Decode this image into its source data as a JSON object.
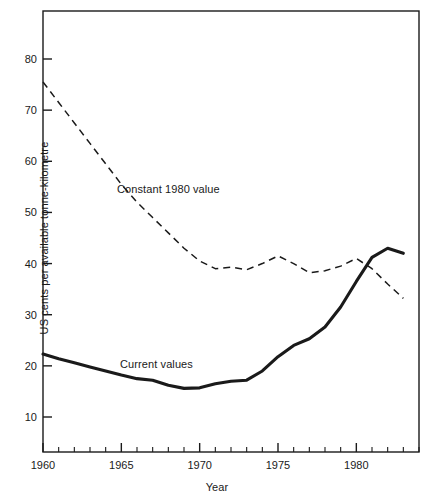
{
  "chart_data": {
    "type": "line",
    "title": "",
    "xlabel": "Year",
    "ylabel": "US cents per available tonne-kilometre",
    "xlim": [
      1960,
      1984
    ],
    "ylim": [
      0,
      88
    ],
    "xticks": [
      1960,
      1965,
      1970,
      1975,
      1980
    ],
    "xtick_labels": [
      "1960",
      "1965",
      "1970",
      "1975",
      "1980"
    ],
    "xtick_minor_step": 1,
    "yticks": [
      10,
      20,
      30,
      40,
      50,
      60,
      70,
      80
    ],
    "ytick_labels": [
      "10",
      "20",
      "30",
      "40",
      "50",
      "60",
      "70",
      "80"
    ],
    "grid": false,
    "legend_position": "inline-annotations",
    "series": [
      {
        "name": "Constant 1980 value",
        "style": "dashed",
        "color": "#1a1a1a",
        "x": [
          1960,
          1961,
          1962,
          1963,
          1964,
          1965,
          1966,
          1967,
          1968,
          1969,
          1970,
          1971,
          1972,
          1973,
          1974,
          1975,
          1976,
          1977,
          1978,
          1979,
          1980,
          1981,
          1982,
          1983
        ],
        "values": [
          75.5,
          71.5,
          67.5,
          63.5,
          59.5,
          55.5,
          52.0,
          49.0,
          46.0,
          43.0,
          40.5,
          39.0,
          39.3,
          38.8,
          40.0,
          41.5,
          40.0,
          38.2,
          38.6,
          39.5,
          41.0,
          39.0,
          36.0,
          33.2
        ]
      },
      {
        "name": "Current values",
        "style": "solid",
        "color": "#1a1a1a",
        "x": [
          1960,
          1961,
          1962,
          1963,
          1964,
          1965,
          1966,
          1967,
          1968,
          1969,
          1970,
          1971,
          1972,
          1973,
          1974,
          1975,
          1976,
          1977,
          1978,
          1979,
          1980,
          1981,
          1982,
          1983
        ],
        "values": [
          22.3,
          21.4,
          20.6,
          19.8,
          19.0,
          18.2,
          17.5,
          17.2,
          16.2,
          15.6,
          15.7,
          16.5,
          17.0,
          17.2,
          19.0,
          21.8,
          24.0,
          25.3,
          27.6,
          31.5,
          36.5,
          41.2,
          43.0,
          42.0
        ]
      }
    ],
    "annotations": [
      {
        "text": "Constant 1980 value",
        "series": "Constant 1980 value"
      },
      {
        "text": "Current values",
        "series": "Current values"
      }
    ]
  },
  "axes": {
    "x_title": "Year",
    "y_title": "US cents per available tonne-kilometre"
  }
}
